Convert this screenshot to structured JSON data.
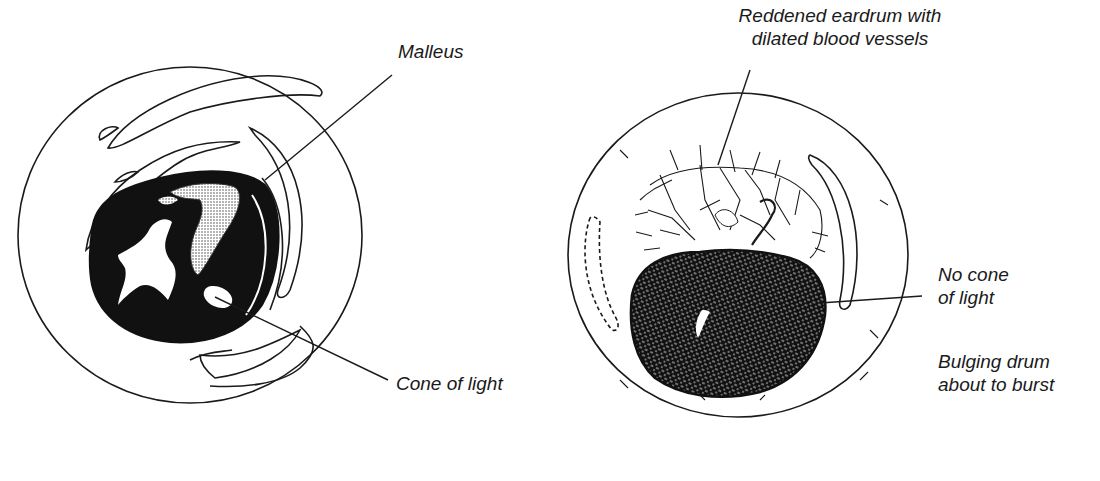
{
  "figure": {
    "left_panel": {
      "description": "Normal eardrum",
      "labels": {
        "malleus": "Malleus",
        "cone_of_light": "Cone of light"
      }
    },
    "right_panel": {
      "description": "Inflamed eardrum",
      "labels": {
        "reddened_line1": "Reddened eardrum with",
        "reddened_line2": "dilated blood vessels",
        "no_cone_line1": "No cone",
        "no_cone_line2": "of light",
        "bulging_line1": "Bulging drum",
        "bulging_line2": "about to burst"
      }
    },
    "colors": {
      "ink": "#1a1a1a",
      "background": "#ffffff",
      "stipple": "#9a9a9a"
    }
  }
}
